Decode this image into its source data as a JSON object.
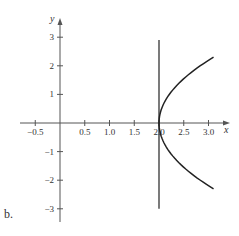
{
  "panel_label": "b.",
  "chart_data": {
    "type": "line",
    "title": "",
    "xlabel": "x",
    "ylabel": "y",
    "xlim": [
      -0.7,
      3.3
    ],
    "ylim": [
      -3.5,
      3.5
    ],
    "x_ticks": [
      -0.5,
      0.5,
      1.0,
      1.5,
      2.0,
      2.5,
      3.0
    ],
    "x_tick_labels": [
      "−0.5",
      "0.5",
      "1.0",
      "1.5",
      "2.0",
      "2.5",
      "3.0"
    ],
    "y_ticks": [
      3,
      2,
      1,
      -1,
      -2,
      -3
    ],
    "y_tick_labels": [
      "3",
      "2",
      "1",
      "−1",
      "−2",
      "−3"
    ],
    "grid": false,
    "series": [
      {
        "name": "curve",
        "description": "rightward-opening parabola with vertex at (2, 0)",
        "points": [
          [
            3.1,
            2.3
          ],
          [
            2.83,
            2.0
          ],
          [
            2.47,
            1.5
          ],
          [
            2.21,
            1.0
          ],
          [
            2.05,
            0.5
          ],
          [
            2.0,
            0.0
          ],
          [
            2.05,
            -0.5
          ],
          [
            2.21,
            -1.0
          ],
          [
            2.47,
            -1.5
          ],
          [
            2.83,
            -2.0
          ],
          [
            3.1,
            -2.3
          ]
        ]
      },
      {
        "name": "vertical line x = 2",
        "points": [
          [
            2.0,
            2.9
          ],
          [
            2.0,
            -3.0
          ]
        ]
      }
    ],
    "colors": {
      "axis": "#555555",
      "curve": "#222222"
    }
  }
}
